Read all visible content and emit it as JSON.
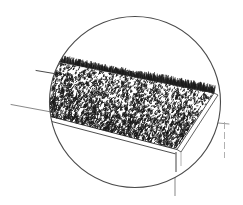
{
  "figure": {
    "kind": "line-art-illustration",
    "background_color": "#ffffff",
    "ink_color": "#1a1a1a",
    "line_color": "#3a3a3a",
    "grey_line_color": "#9a9a9a",
    "caption": ""
  },
  "magnifier": {
    "name": "circular detail view",
    "center_x": 135,
    "center_y": 102,
    "radius": 86,
    "stroke_color": "#4a4a4a",
    "stroke_width": 1.1
  },
  "leaders": [
    {
      "name": "upper-left-leader",
      "x1": 36,
      "y1": 70,
      "x2": 56,
      "y2": 74,
      "color": "#4a4a4a"
    },
    {
      "name": "lower-left-leader",
      "x1": 11,
      "y1": 105,
      "x2": 53,
      "y2": 112,
      "color": "#6a6a6a"
    },
    {
      "name": "right-upper-leader",
      "x1": 196,
      "y1": 122,
      "x2": 228,
      "y2": 124,
      "color": "#7a7a7a"
    },
    {
      "name": "right-vertical-leader",
      "x1": 224,
      "y1": 122,
      "x2": 224,
      "y2": 158,
      "color": "#a0a0a0"
    },
    {
      "name": "bottom-leg-leader",
      "x1": 175,
      "y1": 150,
      "x2": 175,
      "y2": 196,
      "color": "#9a9a9a"
    }
  ],
  "bed": {
    "name": "turf bed slab",
    "top_face_color": "#ffffff",
    "front_rail_color": "#3a3a3a",
    "texture": {
      "name": "grass stipple texture",
      "mark_count": 2600,
      "mark_color": "#1a1a1a",
      "description": "dense scattered short tick marks representing cut grass / turf"
    },
    "frame_corners": {
      "back_left_x": 56,
      "back_left_y": 60,
      "back_right_x": 214,
      "back_right_y": 92,
      "front_right_x": 176,
      "front_right_y": 150,
      "front_left_x": 46,
      "front_left_y": 116
    }
  },
  "legs": [
    {
      "name": "front-right-leg",
      "x": 175,
      "y_top": 150,
      "y_bottom": 196
    },
    {
      "name": "right-frame-edge",
      "x": 224,
      "y_top": 122,
      "y_bottom": 158
    }
  ]
}
